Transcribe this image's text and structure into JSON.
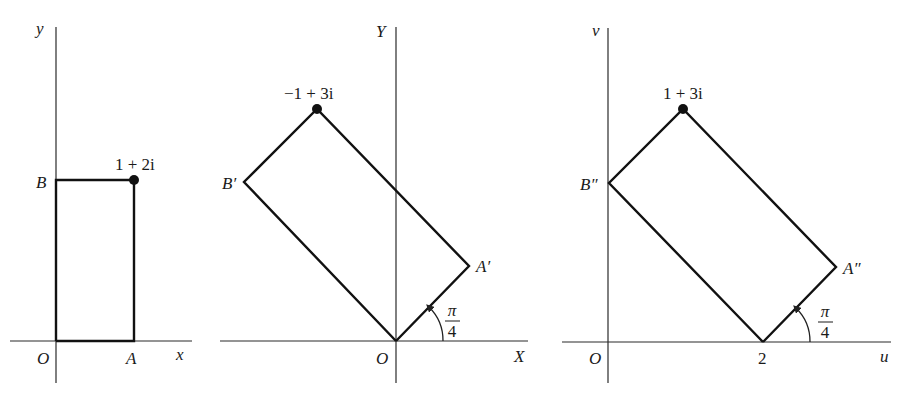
{
  "figure": {
    "colors": {
      "ink": "#111111",
      "axis": "#2a2a2a",
      "background": "#ffffff"
    },
    "panels": [
      {
        "id": "z-plane",
        "axes": {
          "horizontal_label": "x",
          "vertical_label": "y",
          "origin_label": "O"
        },
        "vertices": {
          "A": "A",
          "B": "B",
          "corner": "1 + 2i"
        },
        "highlighted_point": "1 + 2i"
      },
      {
        "id": "rotated-plane",
        "axes": {
          "horizontal_label": "X",
          "vertical_label": "Y",
          "origin_label": "O"
        },
        "vertices": {
          "A": "A′",
          "B": "B′",
          "corner": "−1 + 3i"
        },
        "highlighted_point": "−1 + 3i",
        "angle_label_num": "π",
        "angle_label_den": "4"
      },
      {
        "id": "w-plane",
        "axes": {
          "horizontal_label": "u",
          "vertical_label": "v",
          "origin_label": "O"
        },
        "vertices": {
          "A": "A″",
          "B": "B″",
          "corner": "1 + 3i"
        },
        "highlighted_point": "1 + 3i",
        "angle_label_num": "π",
        "angle_label_den": "4",
        "tick_label": "2"
      }
    ]
  }
}
